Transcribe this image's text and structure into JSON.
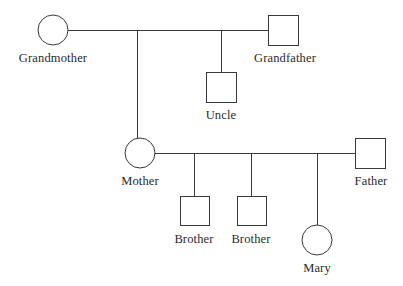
{
  "diagram": {
    "type": "pedigree-chart",
    "canvas": {
      "width": 403,
      "height": 286
    },
    "style": {
      "line_color": "#3a3a3a",
      "line_width": 1,
      "shape_fill": "#ffffff",
      "background": "#ffffff",
      "text_color": "#2b2b2b"
    }
  },
  "nodes": {
    "grandmother": {
      "label": "Grandmother",
      "symbol": "circle",
      "sex": "female",
      "cx": 53,
      "cy": 30,
      "r": 15,
      "label_x": 53,
      "label_y": 52
    },
    "grandfather": {
      "label": "Grandfather",
      "symbol": "square",
      "sex": "male",
      "x": 268,
      "y": 15,
      "size": 30,
      "label_x": 285,
      "label_y": 52
    },
    "uncle": {
      "label": "Uncle",
      "symbol": "square",
      "sex": "male",
      "x": 206,
      "y": 72,
      "size": 30,
      "label_x": 221,
      "label_y": 109
    },
    "mother": {
      "label": "Mother",
      "symbol": "circle",
      "sex": "female",
      "cx": 140,
      "cy": 153,
      "r": 15,
      "label_x": 140,
      "label_y": 175
    },
    "father": {
      "label": "Father",
      "symbol": "square",
      "sex": "male",
      "x": 355,
      "y": 138,
      "size": 30,
      "label_x": 371,
      "label_y": 175
    },
    "brother_one": {
      "label": "Brother",
      "symbol": "square",
      "sex": "male",
      "x": 180,
      "y": 196,
      "size": 29,
      "label_x": 194,
      "label_y": 233
    },
    "brother_two": {
      "label": "Brother",
      "symbol": "square",
      "sex": "male",
      "x": 237,
      "y": 196,
      "size": 29,
      "label_x": 251,
      "label_y": 233
    },
    "mary": {
      "label": "Mary",
      "symbol": "circle",
      "sex": "female",
      "cx": 317,
      "cy": 240,
      "r": 15,
      "label_x": 317,
      "label_y": 262
    }
  },
  "unions": [
    {
      "name": "grandparents-union",
      "partners": [
        "grandmother",
        "grandfather"
      ],
      "line_y": 30,
      "line_x1": 68,
      "line_x2": 268,
      "children": [
        "mother",
        "uncle"
      ]
    },
    {
      "name": "parents-union",
      "partners": [
        "mother",
        "father"
      ],
      "line_y": 153,
      "line_x1": 155,
      "line_x2": 355,
      "children": [
        "brother_one",
        "brother_two",
        "mary"
      ]
    }
  ],
  "connectors": [
    {
      "name": "drop-to-mother",
      "x": 137,
      "y1": 30,
      "y2": 138
    },
    {
      "name": "drop-to-uncle",
      "x": 221,
      "y1": 30,
      "y2": 72
    },
    {
      "name": "drop-to-brother-one",
      "x": 194,
      "y1": 153,
      "y2": 196
    },
    {
      "name": "drop-to-brother-two",
      "x": 251,
      "y1": 153,
      "y2": 196
    },
    {
      "name": "drop-to-mary",
      "x": 317,
      "y1": 153,
      "y2": 225
    }
  ],
  "legend": {
    "circle_meaning": "female",
    "square_meaning": "male"
  }
}
